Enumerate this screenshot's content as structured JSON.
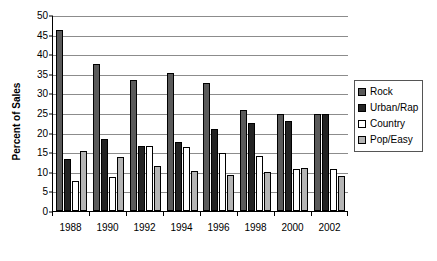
{
  "chart_data": {
    "type": "bar",
    "title": "",
    "xlabel": "",
    "ylabel": "Percent of Sales",
    "ylim": [
      0,
      50
    ],
    "ytick_step": 5,
    "yticks": [
      0,
      5,
      10,
      15,
      20,
      25,
      30,
      35,
      40,
      45,
      50
    ],
    "grid": true,
    "legend_position": "right",
    "categories": [
      "1988",
      "1990",
      "1992",
      "1994",
      "1996",
      "1998",
      "2000",
      "2002"
    ],
    "series": [
      {
        "name": "Rock",
        "color": "#5a5a5a",
        "values": [
          46.2,
          37.5,
          33.4,
          35.2,
          32.7,
          25.8,
          24.8,
          24.8
        ]
      },
      {
        "name": "Urban/Rap",
        "color": "#232323",
        "values": [
          13.3,
          18.3,
          16.7,
          17.5,
          21.0,
          22.5,
          22.9,
          24.8
        ]
      },
      {
        "name": "Country",
        "color": "#ffffff",
        "values": [
          7.6,
          8.8,
          16.5,
          16.4,
          14.8,
          14.0,
          10.7,
          10.6
        ]
      },
      {
        "name": "Pop/Easy",
        "color": "#b4b4b4",
        "values": [
          15.2,
          13.8,
          11.4,
          10.2,
          9.3,
          10.0,
          10.9,
          8.9
        ]
      }
    ]
  },
  "axis": {
    "ytick_labels": [
      "0",
      "5",
      "10",
      "15",
      "20",
      "25",
      "30",
      "35",
      "40",
      "45",
      "50"
    ],
    "xtick_labels": [
      "1988",
      "1990",
      "1992",
      "1994",
      "1996",
      "1998",
      "2000",
      "2002"
    ],
    "y_axis_title": "Percent of Sales"
  },
  "legend": {
    "items": [
      {
        "label": "Rock",
        "swatch": "#5a5a5a"
      },
      {
        "label": "Urban/Rap",
        "swatch": "#232323"
      },
      {
        "label": "Country",
        "swatch": "#ffffff"
      },
      {
        "label": "Pop/Easy",
        "swatch": "#b4b4b4"
      }
    ]
  }
}
